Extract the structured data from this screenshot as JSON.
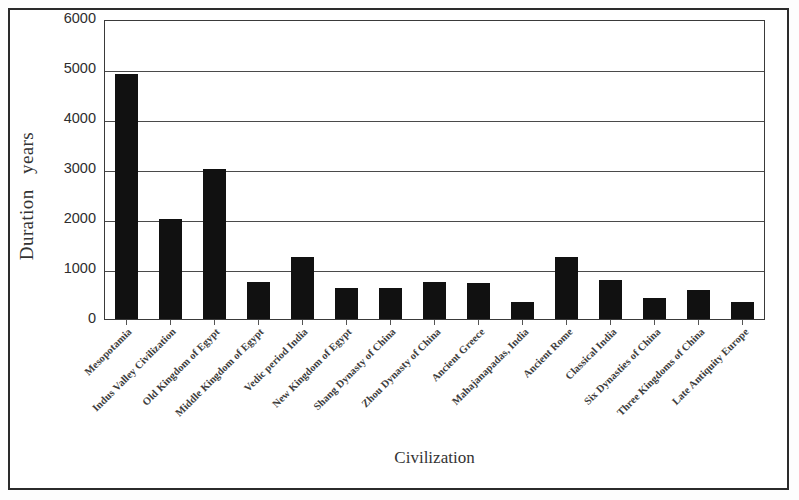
{
  "chart_data": {
    "type": "bar",
    "title": "",
    "xlabel": "Civilization",
    "ylabel": "Duration   years",
    "ylim": [
      0,
      6000
    ],
    "ytick_values": [
      6000,
      5000,
      4000,
      3000,
      2000,
      1000,
      0
    ],
    "ytick_labels": [
      "6000",
      "5000",
      "4000",
      "3000",
      "2000",
      "1000",
      "0"
    ],
    "grid": "horizontal",
    "legend": "none",
    "bar_color": "#111111",
    "categories": [
      "Mesopotamia",
      "Indus Valley Civilization",
      "Old Kingdom of Egypt",
      "Middle Kingdom of Egypt",
      "Vedic period India",
      "New Kingdom of Egypt",
      "Shang Dynasty of China",
      "Zhou Dynasty of China",
      "Ancient Greece",
      "Mahajanapadas, India",
      "Ancient Rome",
      "Classical India",
      "Six Dynasties of China",
      "Three Kingdoms of China",
      "Late Antiquity Europe"
    ],
    "values": [
      4900,
      2000,
      3000,
      750,
      1250,
      620,
      630,
      750,
      720,
      350,
      1250,
      780,
      420,
      580,
      350
    ]
  }
}
